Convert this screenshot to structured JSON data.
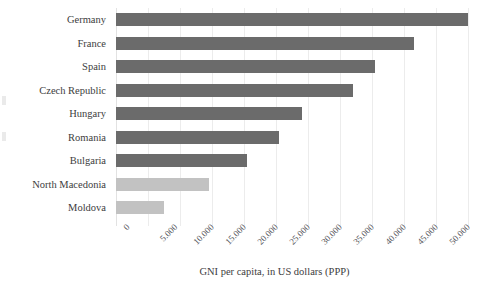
{
  "chart_data": {
    "type": "bar",
    "orientation": "horizontal",
    "title": "",
    "xlabel": "GNI per capita, in US dollars (PPP)",
    "ylabel": "",
    "xlim": [
      0,
      55000
    ],
    "grid": true,
    "legend": "none",
    "categories": [
      "Germany",
      "France",
      "Spain",
      "Czech Republic",
      "Hungary",
      "Romania",
      "Bulgaria",
      "North Macedonia",
      "Moldova"
    ],
    "values": [
      55000,
      46500,
      40500,
      37000,
      29000,
      25500,
      20500,
      14500,
      7500
    ],
    "bar_colors": [
      "#6b6b6b",
      "#6b6b6b",
      "#6b6b6b",
      "#6b6b6b",
      "#6b6b6b",
      "#6b6b6b",
      "#6b6b6b",
      "#c2c2c2",
      "#c2c2c2"
    ],
    "xticks": [
      0,
      5000,
      10000,
      15000,
      20000,
      25000,
      30000,
      35000,
      40000,
      45000,
      50000,
      55000
    ],
    "xtick_labels": [
      "0",
      "5.000",
      "10.000",
      "15.000",
      "20.000",
      "25.000",
      "30.000",
      "35.000",
      "40.000",
      "45.000",
      "50.000",
      "55.000"
    ],
    "colors": {
      "background": "#ffffff",
      "gridline": "#ececec",
      "bar_dark": "#6b6b6b",
      "bar_light": "#c2c2c2",
      "text": "#3d3d3d",
      "tick_text": "#55555a"
    }
  }
}
